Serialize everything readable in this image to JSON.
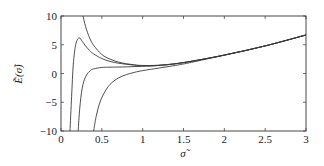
{
  "chart_data": {
    "type": "line",
    "title": "",
    "xlabel": "σ̃",
    "ylabel": "Ẽ(σ̃)",
    "xlim": [
      0,
      3
    ],
    "ylim": [
      -10,
      10
    ],
    "grid": false,
    "legend": null,
    "xticks": [
      0,
      0.5,
      1,
      1.5,
      2,
      2.5,
      3
    ],
    "xtick_labels": [
      "0",
      "0.5",
      "1",
      "1.5",
      "2",
      "2.5",
      "3"
    ],
    "yticks": [
      -10,
      -5,
      0,
      5,
      10
    ],
    "ytick_labels": [
      "−10",
      "−5",
      "0",
      "5",
      "10"
    ],
    "series": [
      {
        "name": "curve-1",
        "x": [
          0.27,
          0.3,
          0.35,
          0.4,
          0.5,
          0.6,
          0.7,
          0.8,
          0.9,
          1.0,
          1.2,
          1.5,
          2.0,
          2.5,
          3.0
        ],
        "y": [
          10,
          8.2,
          6.2,
          4.9,
          3.3,
          2.5,
          2.0,
          1.7,
          1.5,
          1.4,
          1.45,
          1.9,
          3.2,
          4.8,
          6.7
        ]
      },
      {
        "name": "curve-2",
        "x": [
          0.11,
          0.13,
          0.15,
          0.18,
          0.22,
          0.26,
          0.3,
          0.35,
          0.4,
          0.5,
          0.6,
          0.7,
          0.8,
          0.9,
          1.0,
          1.2,
          1.5,
          2.0,
          2.5,
          3.0
        ],
        "y": [
          -10,
          -4,
          1.5,
          5.0,
          6.2,
          5.6,
          4.8,
          4.0,
          3.4,
          2.6,
          2.1,
          1.8,
          1.6,
          1.45,
          1.35,
          1.4,
          1.9,
          3.2,
          4.8,
          6.7
        ]
      },
      {
        "name": "curve-3",
        "x": [
          0.21,
          0.23,
          0.26,
          0.3,
          0.35,
          0.4,
          0.5,
          0.6,
          0.8,
          1.0,
          1.2,
          1.5,
          2.0,
          2.5,
          3.0
        ],
        "y": [
          -10,
          -6,
          -2.5,
          -0.6,
          0.4,
          0.8,
          1.05,
          1.1,
          1.15,
          1.25,
          1.4,
          1.9,
          3.2,
          4.8,
          6.7
        ]
      },
      {
        "name": "curve-4",
        "x": [
          0.4,
          0.43,
          0.47,
          0.52,
          0.6,
          0.7,
          0.8,
          0.9,
          1.0,
          1.2,
          1.4,
          1.6,
          2.0,
          2.5,
          3.0
        ],
        "y": [
          -10,
          -7.5,
          -5.3,
          -3.6,
          -1.9,
          -0.8,
          -0.2,
          0.2,
          0.5,
          0.95,
          1.4,
          1.95,
          3.2,
          4.8,
          6.7
        ]
      }
    ]
  }
}
